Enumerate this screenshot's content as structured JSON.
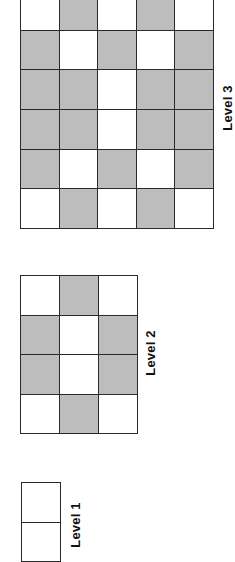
{
  "colors": {
    "shaded": "#bdbdbd",
    "empty": "#ffffff",
    "border": "#2a2a2a"
  },
  "levels": [
    {
      "label": "Level 1",
      "rows": 2,
      "cols": 1,
      "cells": [
        [
          0
        ],
        [
          0
        ]
      ]
    },
    {
      "label": "Level 2",
      "rows": 4,
      "cols": 3,
      "cells": [
        [
          0,
          1,
          0
        ],
        [
          1,
          0,
          1
        ],
        [
          1,
          0,
          1
        ],
        [
          0,
          1,
          0
        ]
      ]
    },
    {
      "label": "Level 3",
      "rows": 6,
      "cols": 5,
      "cells": [
        [
          0,
          1,
          0,
          1,
          0
        ],
        [
          1,
          0,
          1,
          0,
          1
        ],
        [
          1,
          1,
          0,
          1,
          1
        ],
        [
          1,
          1,
          0,
          1,
          1
        ],
        [
          1,
          0,
          1,
          0,
          1
        ],
        [
          0,
          1,
          0,
          1,
          0
        ]
      ]
    }
  ]
}
